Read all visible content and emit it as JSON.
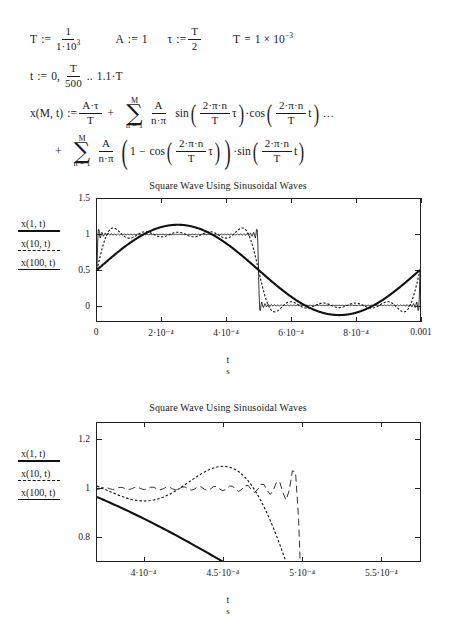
{
  "equations": {
    "line1": {
      "T_def_label": "T",
      "assign": ":=",
      "T_num": "1",
      "T_den_coef": "1·10",
      "T_den_exp": "3",
      "A_label": "A",
      "A_value": "1",
      "tau_label": "τ",
      "tau_num": "T",
      "tau_den": "2",
      "T_eval_label": "T",
      "equals": "=",
      "T_eval_value": "1 × 10",
      "T_eval_exp": "−3"
    },
    "line2": {
      "t_label": "t",
      "assign": ":=",
      "start": "0,",
      "step_num": "T",
      "step_den": "500",
      "range_dots": "..",
      "end": "1.1·T"
    },
    "line3": {
      "lhs": "x(M, t)",
      "assign": ":=",
      "term1_num": "A·τ",
      "term1_den": "T",
      "plus": "+",
      "sum_top": "M",
      "sum_sym": "∑",
      "sum_bot": "n = 1",
      "coef_num": "A",
      "coef_den": "n·π",
      "fn1": "sin",
      "arg1_num": "2·π·n",
      "arg1_den": "T",
      "arg1_tail": "τ",
      "dot": "·",
      "fn2": "cos",
      "arg2_num": "2·π·n",
      "arg2_den": "T",
      "arg2_tail": "t",
      "trailing": "..."
    },
    "line4": {
      "plus": "+",
      "sum_top": "M",
      "sum_sym": "∑",
      "sum_bot": "n = 1",
      "coef_num": "A",
      "coef_den": "n·π",
      "one_minus": "1 −",
      "fn1": "cos",
      "arg1_num": "2·π·n",
      "arg1_den": "T",
      "arg1_tail": "τ",
      "dot": "·",
      "fn2": "sin",
      "arg2_num": "2·π·n",
      "arg2_den": "T",
      "arg2_tail": "t"
    }
  },
  "legend": {
    "entries": [
      {
        "label": "x(1, t)",
        "style": "solid-thick"
      },
      {
        "label": "x(10, t)",
        "style": "dashed"
      },
      {
        "label": "x(100, t)",
        "style": "solid-thin"
      }
    ]
  },
  "chart_data": [
    {
      "id": "chart-1",
      "type": "line",
      "title": "Square Wave Using Sinusoidal Waves",
      "xlabel": "t",
      "xunit": "s",
      "ylabel": "",
      "xlim": [
        0,
        0.001
      ],
      "ylim": [
        -0.22,
        1.5
      ],
      "xticks": [
        0,
        0.0002,
        0.0004,
        0.0006,
        0.0008,
        0.001
      ],
      "xticklabels": [
        "0",
        "2·10⁻⁴",
        "4·10⁻⁴",
        "6·10⁻⁴",
        "8·10⁻⁴",
        "0.001"
      ],
      "yticks": [
        0,
        0.5,
        1,
        1.5
      ],
      "yticklabels": [
        "0",
        "0.5",
        "1",
        "1.5"
      ],
      "grid": false,
      "legend_position": "left-outside",
      "series": [
        {
          "name": "x(1, t)",
          "M": 1,
          "style": "solid-thick"
        },
        {
          "name": "x(10, t)",
          "M": 10,
          "style": "dashed"
        },
        {
          "name": "x(100, t)",
          "M": 100,
          "style": "solid-thin"
        }
      ],
      "params": {
        "T": 0.001,
        "A": 1,
        "tau": 0.0005
      }
    },
    {
      "id": "chart-2",
      "type": "line",
      "title": "Square Wave Using Sinusoidal Waves",
      "xlabel": "t",
      "xunit": "s",
      "ylabel": "",
      "xlim": [
        0.00037,
        0.000575
      ],
      "ylim": [
        0.7,
        1.27
      ],
      "xticks": [
        0.0004,
        0.00045,
        0.0005,
        0.00055
      ],
      "xticklabels": [
        "4·10⁻⁴",
        "4.5·10⁻⁴",
        "5·10⁻⁴",
        "5.5·10⁻⁴"
      ],
      "yticks": [
        0.8,
        1,
        1.2
      ],
      "yticklabels": [
        "0.8",
        "1",
        "1.2"
      ],
      "grid": false,
      "legend_position": "left-outside",
      "series": [
        {
          "name": "x(1, t)",
          "M": 1,
          "style": "solid-thick"
        },
        {
          "name": "x(10, t)",
          "M": 10,
          "style": "dashed"
        },
        {
          "name": "x(100, t)",
          "M": 100,
          "style": "solid-thin"
        }
      ],
      "params": {
        "T": 0.001,
        "A": 1,
        "tau": 0.0005
      }
    }
  ]
}
